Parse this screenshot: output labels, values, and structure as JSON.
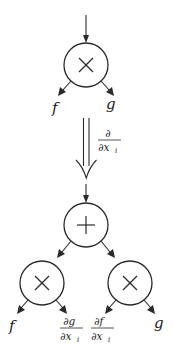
{
  "diagram": {
    "before": {
      "root": {
        "op": "×",
        "op_name": "multiply"
      },
      "children": [
        {
          "label": "f"
        },
        {
          "label": "g"
        }
      ]
    },
    "transform": {
      "arrow": "double-down",
      "label_num": "∂",
      "label_den": "∂x",
      "label_den_sub": "i"
    },
    "after": {
      "root": {
        "op": "+",
        "op_name": "add"
      },
      "left": {
        "op": "×",
        "op_name": "multiply",
        "children": [
          {
            "label": "f"
          },
          {
            "num": "∂g",
            "den": "∂x",
            "den_sub": "i"
          }
        ]
      },
      "right": {
        "op": "×",
        "op_name": "multiply",
        "children": [
          {
            "num": "∂f",
            "den": "∂x",
            "den_sub": "i"
          },
          {
            "label": "g"
          }
        ]
      }
    },
    "colors": {
      "stroke": "#2a2a2a",
      "background": "#ffffff"
    }
  }
}
